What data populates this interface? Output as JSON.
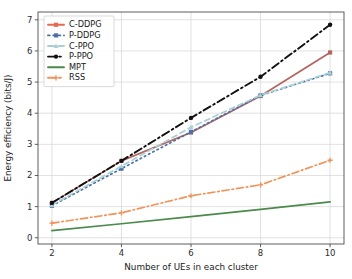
{
  "chart_data": {
    "type": "line",
    "title": "",
    "xlabel": "Number of UEs in each cluster",
    "ylabel": "Energy efficiency (bits/J)",
    "x": [
      2,
      4,
      6,
      8,
      10
    ],
    "xlim": [
      1.6,
      10.4
    ],
    "ylim": [
      -0.2,
      7.25
    ],
    "xticks": [
      2,
      4,
      6,
      8,
      10
    ],
    "yticks": [
      0,
      1,
      2,
      3,
      4,
      5,
      6,
      7
    ],
    "xtick_labels": [
      "2",
      "4",
      "6",
      "8",
      "10"
    ],
    "ytick_labels": [
      "0",
      "1",
      "2",
      "3",
      "4",
      "5",
      "6",
      "7"
    ],
    "grid": true,
    "legend_position": "upper left",
    "series": [
      {
        "name": "C-DDPG",
        "values": [
          1.12,
          2.47,
          3.38,
          4.55,
          5.95
        ],
        "color": "#b5655f",
        "legend_color": "#e8694f",
        "style": "solid",
        "marker": "square"
      },
      {
        "name": "P-DDPG",
        "values": [
          1.03,
          2.22,
          3.4,
          4.57,
          5.28
        ],
        "color": "#4b6fa8",
        "legend_color": "#4b6fa8",
        "style": "dotted",
        "marker": "square"
      },
      {
        "name": "C-PPO",
        "values": [
          1.05,
          2.3,
          3.55,
          4.58,
          5.3
        ],
        "color": "#a8cfd4",
        "legend_color": "#a8cfd4",
        "style": "dashed",
        "marker": "triangle"
      },
      {
        "name": "P-PPO",
        "values": [
          1.12,
          2.47,
          3.85,
          5.17,
          6.84
        ],
        "color": "#111111",
        "legend_color": "#111111",
        "style": "dashdot",
        "marker": "circle"
      },
      {
        "name": "MPT",
        "values": [
          0.23,
          0.45,
          0.68,
          0.91,
          1.15
        ],
        "color": "#4a8a4a",
        "legend_color": "#4a8a4a",
        "style": "solid",
        "marker": "none"
      },
      {
        "name": "RSS",
        "values": [
          0.47,
          0.8,
          1.35,
          1.7,
          2.49
        ],
        "color": "#f0945c",
        "legend_color": "#f0945c",
        "style": "dashdot",
        "marker": "plus"
      }
    ]
  }
}
